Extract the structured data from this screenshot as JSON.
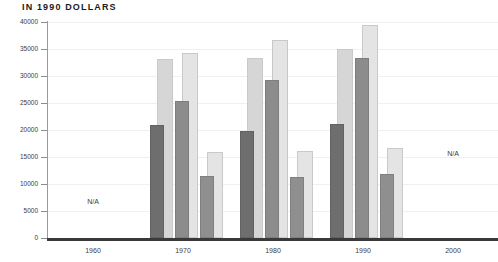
{
  "chart_data": {
    "type": "bar",
    "title": "IN 1990 DOLLARS",
    "xlabel": "",
    "ylabel": "",
    "ylim": [
      0,
      40000
    ],
    "grid": true,
    "legend_position": "none",
    "categories": [
      "1960",
      "1970",
      "1980",
      "1990",
      "2000"
    ],
    "y_ticks": [
      0,
      5000,
      10000,
      15000,
      20000,
      25000,
      30000,
      35000,
      40000
    ],
    "y_tick_labels": [
      "0",
      "5000",
      "10000",
      "15000",
      "20000",
      "25000",
      "30000",
      "35000",
      "40000"
    ],
    "annotations": [
      {
        "text": "N/A",
        "category": "1960",
        "value": 6600
      },
      {
        "text": "N/A",
        "category": "2000",
        "value": 15600
      }
    ],
    "groups": [
      {
        "category": "1960",
        "data_available": false,
        "pairs": []
      },
      {
        "category": "1970",
        "data_available": true,
        "pairs": [
          {
            "name": "pair-1",
            "back": 33200,
            "front": 21000
          },
          {
            "name": "pair-2",
            "back": 34200,
            "front": 25300
          },
          {
            "name": "pair-3",
            "back": 16000,
            "front": 11400
          }
        ]
      },
      {
        "category": "1980",
        "data_available": true,
        "pairs": [
          {
            "name": "pair-1",
            "back": 33300,
            "front": 19900
          },
          {
            "name": "pair-2",
            "back": 36600,
            "front": 29300
          },
          {
            "name": "pair-3",
            "back": 16200,
            "front": 11300
          }
        ]
      },
      {
        "category": "1990",
        "data_available": true,
        "pairs": [
          {
            "name": "pair-1",
            "back": 35000,
            "front": 21100
          },
          {
            "name": "pair-2",
            "back": 39500,
            "front": 33400
          },
          {
            "name": "pair-3",
            "back": 16700,
            "front": 11800
          }
        ]
      },
      {
        "category": "2000",
        "data_available": false,
        "pairs": []
      }
    ],
    "series": [
      {
        "name": "series-1-back",
        "role": "background",
        "values": [
          null,
          33200,
          33300,
          35000,
          null
        ]
      },
      {
        "name": "series-1-front",
        "role": "foreground",
        "values": [
          null,
          21000,
          19900,
          21100,
          null
        ]
      },
      {
        "name": "series-2-back",
        "role": "background",
        "values": [
          null,
          34200,
          36600,
          39500,
          null
        ]
      },
      {
        "name": "series-2-front",
        "role": "foreground",
        "values": [
          null,
          25300,
          29300,
          33400,
          null
        ]
      },
      {
        "name": "series-3-back",
        "role": "background",
        "values": [
          null,
          16000,
          16200,
          16700,
          null
        ]
      },
      {
        "name": "series-3-front",
        "role": "foreground",
        "values": [
          null,
          11400,
          11300,
          11800,
          null
        ]
      }
    ]
  },
  "colors": {
    "background": "#ffffff",
    "bar_back": "#d6d6d6",
    "bar_back_light": "#e4e4e4",
    "bar_front_dark": "#6e6e6e",
    "bar_front_mid": "#8c8c8c",
    "bar_front_light": "#8f8f8f",
    "axis": "#3a3a3a",
    "gridline": "#f2eff0",
    "text": "#3c3c3c",
    "title": "#1b1b1b"
  }
}
